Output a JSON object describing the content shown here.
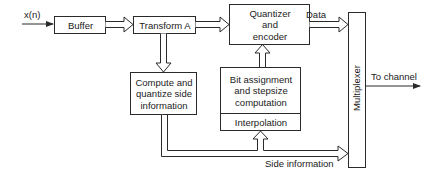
{
  "diagram": {
    "input_label": "x(n)",
    "blocks": {
      "buffer": "Buffer",
      "transform": "Transform A",
      "quantizer": "Quantizer\nand\nencoder",
      "compute": "Compute and\nquantize side\ninformation",
      "bit_assignment": "Bit assignment\nand stepsize\ncomputation",
      "interpolation": "Interpolation",
      "multiplexer": "Multiplexer"
    },
    "edge_labels": {
      "data": "Data",
      "side_information": "Side information",
      "to_channel": "To channel"
    },
    "colors": {
      "line": "#2a2a2a",
      "background": "#ffffff"
    }
  }
}
